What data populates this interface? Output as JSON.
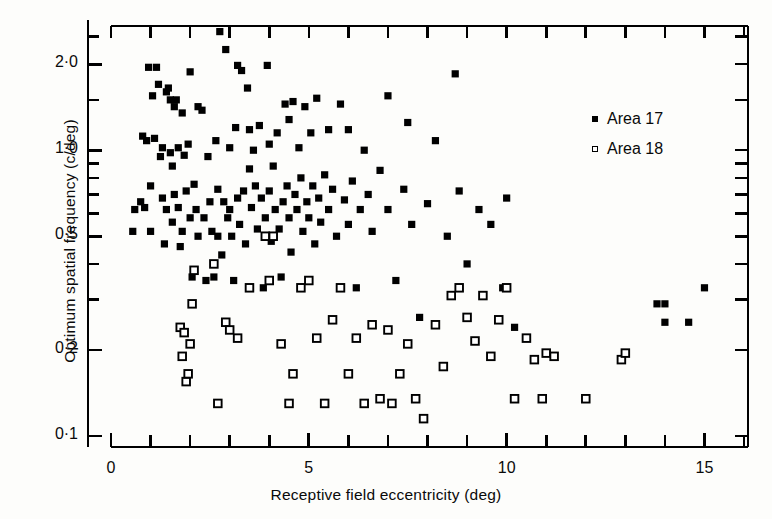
{
  "chart_data": {
    "type": "scatter",
    "title": "",
    "xlabel": "Receptive field eccentricity (deg)",
    "ylabel": "Optimum spatial frequency (c/deg)",
    "xscale": "linear",
    "yscale": "log",
    "xlim": [
      0,
      16.1
    ],
    "ylim": [
      0.093,
      2.72
    ],
    "grid": false,
    "legend_position": "upper-right",
    "x_ticks_major": [
      0,
      5,
      10,
      15
    ],
    "x_tick_labels": [
      "0",
      "5",
      "10",
      "15"
    ],
    "x_ticks_minor": [
      1,
      2,
      3,
      4,
      6,
      7,
      8,
      9,
      11,
      12,
      13,
      14,
      16
    ],
    "y_ticks_major": [
      0.1,
      0.2,
      0.5,
      1.0,
      2.0
    ],
    "y_tick_labels": [
      "0·1",
      "0·2",
      "0·5",
      "1·0",
      "2·0"
    ],
    "y_ticks_minor": [
      0.3,
      0.4,
      0.6,
      0.7,
      0.8,
      0.9,
      1.5,
      2.5
    ],
    "series": [
      {
        "name": "Area 17",
        "marker": "filled-square",
        "color": "#000000",
        "points": [
          [
            0.55,
            0.52
          ],
          [
            0.6,
            0.62
          ],
          [
            0.75,
            0.66
          ],
          [
            0.8,
            1.12
          ],
          [
            0.85,
            0.63
          ],
          [
            0.9,
            1.08
          ],
          [
            0.95,
            1.95
          ],
          [
            1.0,
            0.52
          ],
          [
            1.0,
            0.75
          ],
          [
            1.05,
            1.55
          ],
          [
            1.1,
            1.1
          ],
          [
            1.15,
            1.95
          ],
          [
            1.2,
            1.7
          ],
          [
            1.25,
            0.95
          ],
          [
            1.3,
            0.68
          ],
          [
            1.3,
            1.02
          ],
          [
            1.35,
            0.47
          ],
          [
            1.4,
            1.6
          ],
          [
            1.4,
            0.62
          ],
          [
            1.45,
            1.65
          ],
          [
            1.5,
            1.5
          ],
          [
            1.5,
            0.98
          ],
          [
            1.55,
            0.88
          ],
          [
            1.55,
            0.56
          ],
          [
            1.6,
            1.42
          ],
          [
            1.6,
            0.7
          ],
          [
            1.65,
            1.5
          ],
          [
            1.7,
            1.02
          ],
          [
            1.7,
            0.63
          ],
          [
            1.75,
            0.46
          ],
          [
            1.8,
            1.35
          ],
          [
            1.8,
            0.52
          ],
          [
            1.85,
            0.96
          ],
          [
            1.9,
            0.72
          ],
          [
            1.95,
            1.05
          ],
          [
            2.0,
            0.58
          ],
          [
            2.0,
            1.88
          ],
          [
            2.05,
            0.36
          ],
          [
            2.1,
            0.76
          ],
          [
            2.15,
            0.62
          ],
          [
            2.2,
            1.42
          ],
          [
            2.2,
            0.5
          ],
          [
            2.3,
            1.38
          ],
          [
            2.35,
            0.58
          ],
          [
            2.4,
            0.35
          ],
          [
            2.45,
            0.95
          ],
          [
            2.5,
            0.66
          ],
          [
            2.55,
            0.52
          ],
          [
            2.6,
            0.36
          ],
          [
            2.65,
            1.08
          ],
          [
            2.7,
            0.73
          ],
          [
            2.7,
            0.5
          ],
          [
            2.75,
            2.6
          ],
          [
            2.8,
            0.43
          ],
          [
            2.85,
            0.66
          ],
          [
            2.9,
            2.25
          ],
          [
            2.95,
            0.58
          ],
          [
            3.0,
            1.02
          ],
          [
            3.0,
            0.62
          ],
          [
            3.05,
            0.5
          ],
          [
            3.1,
            0.35
          ],
          [
            3.15,
            1.2
          ],
          [
            3.2,
            0.68
          ],
          [
            3.2,
            1.98
          ],
          [
            3.25,
            0.55
          ],
          [
            3.3,
            1.9
          ],
          [
            3.35,
            0.72
          ],
          [
            3.4,
            0.47
          ],
          [
            3.45,
            1.65
          ],
          [
            3.5,
            1.18
          ],
          [
            3.5,
            0.86
          ],
          [
            3.55,
            0.63
          ],
          [
            3.6,
            1.0
          ],
          [
            3.65,
            0.75
          ],
          [
            3.7,
            0.53
          ],
          [
            3.75,
            1.22
          ],
          [
            3.8,
            0.68
          ],
          [
            3.85,
            0.33
          ],
          [
            3.9,
            0.58
          ],
          [
            3.95,
            1.98
          ],
          [
            4.0,
            1.05
          ],
          [
            4.0,
            0.72
          ],
          [
            4.05,
            0.48
          ],
          [
            4.1,
            0.88
          ],
          [
            4.15,
            0.62
          ],
          [
            4.2,
            1.15
          ],
          [
            4.25,
            0.53
          ],
          [
            4.3,
            0.36
          ],
          [
            4.35,
            0.66
          ],
          [
            4.4,
            1.45
          ],
          [
            4.45,
            0.75
          ],
          [
            4.5,
            1.28
          ],
          [
            4.5,
            0.58
          ],
          [
            4.55,
            0.44
          ],
          [
            4.6,
            1.48
          ],
          [
            4.65,
            0.7
          ],
          [
            4.7,
            0.62
          ],
          [
            4.75,
            1.02
          ],
          [
            4.8,
            0.8
          ],
          [
            4.85,
            0.52
          ],
          [
            4.9,
            1.42
          ],
          [
            4.95,
            0.66
          ],
          [
            5.0,
            0.58
          ],
          [
            5.05,
            1.15
          ],
          [
            5.1,
            0.75
          ],
          [
            5.15,
            0.47
          ],
          [
            5.2,
            1.52
          ],
          [
            5.25,
            0.68
          ],
          [
            5.3,
            0.56
          ],
          [
            5.4,
            0.82
          ],
          [
            5.5,
            1.18
          ],
          [
            5.5,
            0.62
          ],
          [
            5.6,
            0.73
          ],
          [
            5.7,
            0.5
          ],
          [
            5.8,
            1.45
          ],
          [
            5.9,
            0.67
          ],
          [
            6.0,
            1.18
          ],
          [
            6.0,
            0.55
          ],
          [
            6.1,
            0.78
          ],
          [
            6.2,
            0.33
          ],
          [
            6.3,
            0.62
          ],
          [
            6.4,
            1.0
          ],
          [
            6.5,
            0.7
          ],
          [
            6.6,
            0.52
          ],
          [
            6.8,
            0.85
          ],
          [
            7.0,
            1.55
          ],
          [
            7.0,
            0.62
          ],
          [
            7.2,
            0.35
          ],
          [
            7.4,
            0.73
          ],
          [
            7.5,
            1.25
          ],
          [
            7.6,
            0.55
          ],
          [
            7.8,
            0.26
          ],
          [
            8.0,
            0.65
          ],
          [
            8.2,
            1.08
          ],
          [
            8.5,
            0.5
          ],
          [
            8.7,
            1.85
          ],
          [
            8.8,
            0.72
          ],
          [
            9.0,
            0.4
          ],
          [
            9.3,
            0.62
          ],
          [
            9.6,
            0.55
          ],
          [
            9.9,
            0.33
          ],
          [
            10.0,
            0.68
          ],
          [
            10.2,
            0.24
          ],
          [
            13.8,
            0.29
          ],
          [
            14.0,
            0.29
          ],
          [
            14.0,
            0.25
          ],
          [
            14.6,
            0.25
          ],
          [
            15.0,
            0.33
          ]
        ]
      },
      {
        "name": "Area 18",
        "marker": "open-square",
        "color": "#000000",
        "points": [
          [
            1.75,
            0.24
          ],
          [
            1.8,
            0.19
          ],
          [
            1.85,
            0.23
          ],
          [
            1.9,
            0.155
          ],
          [
            1.95,
            0.165
          ],
          [
            2.0,
            0.21
          ],
          [
            2.05,
            0.29
          ],
          [
            2.1,
            0.38
          ],
          [
            2.6,
            0.4
          ],
          [
            2.7,
            0.13
          ],
          [
            2.9,
            0.25
          ],
          [
            3.0,
            0.235
          ],
          [
            3.2,
            0.22
          ],
          [
            3.5,
            0.33
          ],
          [
            3.9,
            0.5
          ],
          [
            4.0,
            0.35
          ],
          [
            4.1,
            0.5
          ],
          [
            4.3,
            0.21
          ],
          [
            4.5,
            0.13
          ],
          [
            4.6,
            0.165
          ],
          [
            4.8,
            0.33
          ],
          [
            5.0,
            0.35
          ],
          [
            5.2,
            0.22
          ],
          [
            5.4,
            0.13
          ],
          [
            5.6,
            0.255
          ],
          [
            5.8,
            0.33
          ],
          [
            6.0,
            0.165
          ],
          [
            6.2,
            0.22
          ],
          [
            6.4,
            0.13
          ],
          [
            6.6,
            0.245
          ],
          [
            6.8,
            0.135
          ],
          [
            7.0,
            0.235
          ],
          [
            7.1,
            0.13
          ],
          [
            7.3,
            0.165
          ],
          [
            7.5,
            0.21
          ],
          [
            7.7,
            0.135
          ],
          [
            7.9,
            0.115
          ],
          [
            8.2,
            0.245
          ],
          [
            8.4,
            0.175
          ],
          [
            8.6,
            0.31
          ],
          [
            8.8,
            0.33
          ],
          [
            9.0,
            0.26
          ],
          [
            9.2,
            0.215
          ],
          [
            9.4,
            0.31
          ],
          [
            9.6,
            0.19
          ],
          [
            9.8,
            0.255
          ],
          [
            10.0,
            0.33
          ],
          [
            10.2,
            0.135
          ],
          [
            10.5,
            0.22
          ],
          [
            10.7,
            0.185
          ],
          [
            10.9,
            0.135
          ],
          [
            11.0,
            0.195
          ],
          [
            11.2,
            0.19
          ],
          [
            12.0,
            0.135
          ],
          [
            12.9,
            0.185
          ],
          [
            13.0,
            0.195
          ]
        ]
      }
    ]
  },
  "legend": {
    "items": [
      {
        "label": "Area 17",
        "marker": "filled-square"
      },
      {
        "label": "Area 18",
        "marker": "open-square"
      }
    ]
  }
}
